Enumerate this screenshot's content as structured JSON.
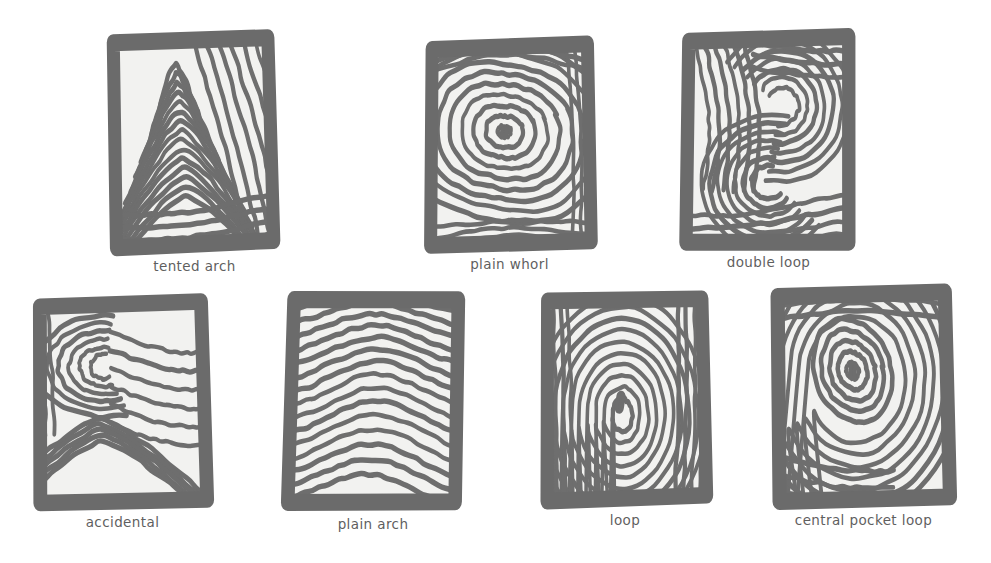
{
  "page": {
    "background_color": "#ffffff",
    "ink_color": "#6b6b6b",
    "card_fill_color": "#f2f2f0",
    "label_color": "#5f5f5f",
    "style": "hand-drawn sketch"
  },
  "cards": [
    {
      "id": "tented-arch",
      "label": "tented arch",
      "row": 1,
      "column": 1,
      "pattern": "tented-arch",
      "description": "ridges rise to a sharp central peak",
      "frame": {
        "x": 113,
        "y": 38,
        "width": 163,
        "height": 212,
        "rotation": -1.5
      },
      "label_position": {
        "x": 113,
        "y": 258,
        "width": 163
      }
    },
    {
      "id": "plain-whorl",
      "label": "plain whorl",
      "row": 1,
      "column": 2,
      "pattern": "plain-whorl",
      "description": "concentric rings circling a small core",
      "frame": {
        "x": 428,
        "y": 40,
        "width": 163,
        "height": 208,
        "rotation": -0.8
      },
      "label_position": {
        "x": 428,
        "y": 256,
        "width": 163
      }
    },
    {
      "id": "double-loop",
      "label": "double loop",
      "row": 1,
      "column": 3,
      "pattern": "double-loop",
      "description": "two interlocking S-shaped loops",
      "frame": {
        "x": 685,
        "y": 34,
        "width": 167,
        "height": 212,
        "rotation": 0.4
      },
      "label_position": {
        "x": 685,
        "y": 254,
        "width": 167
      }
    },
    {
      "id": "accidental",
      "label": "accidental",
      "row": 2,
      "column": 1,
      "pattern": "accidental",
      "description": "mixed loop and arch ridges",
      "frame": {
        "x": 36,
        "y": 298,
        "width": 173,
        "height": 206,
        "rotation": -1.2
      },
      "label_position": {
        "x": 36,
        "y": 514,
        "width": 173
      }
    },
    {
      "id": "plain-arch",
      "label": "plain arch",
      "row": 2,
      "column": 2,
      "pattern": "plain-arch",
      "description": "gentle wave ridges flowing side to side",
      "frame": {
        "x": 288,
        "y": 295,
        "width": 170,
        "height": 212,
        "rotation": 1.6
      },
      "label_position": {
        "x": 288,
        "y": 516,
        "width": 170
      }
    },
    {
      "id": "loop",
      "label": "loop",
      "row": 2,
      "column": 3,
      "pattern": "loop",
      "description": "nested U-curves around a single core",
      "frame": {
        "x": 543,
        "y": 294,
        "width": 164,
        "height": 208,
        "rotation": -0.6
      },
      "label_position": {
        "x": 543,
        "y": 512,
        "width": 164
      }
    },
    {
      "id": "central-pocket-loop",
      "label": "central pocket loop",
      "row": 2,
      "column": 4,
      "pattern": "central-pocket-loop",
      "description": "loop ridges enclosing a small oval pocket core",
      "frame": {
        "x": 775,
        "y": 290,
        "width": 177,
        "height": 212,
        "rotation": -0.5
      },
      "label_position": {
        "x": 775,
        "y": 512,
        "width": 177
      }
    }
  ]
}
